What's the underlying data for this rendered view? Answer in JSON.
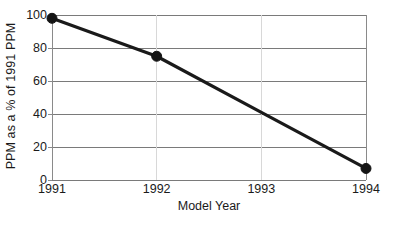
{
  "chart_data": {
    "type": "line",
    "title": "",
    "xlabel": "Model Year",
    "ylabel": "PPM as a % of 1991 PPM",
    "categories": [
      "1991",
      "1992",
      "1993",
      "1994"
    ],
    "x": [
      1991,
      1992,
      1993,
      1994
    ],
    "values": [
      98,
      75,
      41,
      7
    ],
    "markers_shown_at": [
      "1991",
      "1992",
      "1994"
    ],
    "series": [
      {
        "name": "PPM as a % of 1991 PPM",
        "values": [
          98,
          75,
          41,
          7
        ],
        "color": "#1a1a1a",
        "marker": "filled-circle"
      }
    ],
    "ylim": [
      0,
      100
    ],
    "xlim": [
      1991,
      1994
    ],
    "yticks": [
      0,
      20,
      40,
      60,
      80,
      100
    ],
    "ytick_labels": [
      "0",
      "20",
      "40",
      "60",
      "80",
      "100"
    ],
    "xticks": [
      1991,
      1992,
      1993,
      1994
    ],
    "xtick_labels": [
      "1991",
      "1992",
      "1993",
      "1994"
    ],
    "grid": {
      "horizontal": true,
      "vertical": true,
      "horizontal_color": "#7a7a7a",
      "vertical_color": "#d8d8d8"
    },
    "legend": null,
    "legend_position": "none"
  },
  "colors": {
    "background": "#ffffff",
    "line": "#1a1a1a",
    "marker": "#141414",
    "text": "#1a1a1a",
    "gridline_horizontal": "#7a7a7a",
    "gridline_vertical": "#d8d8d8",
    "axis": "#8a8a8a"
  },
  "footer": {
    "clipped_text": ""
  }
}
